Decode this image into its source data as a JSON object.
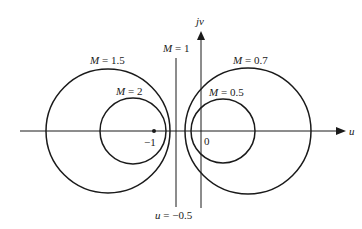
{
  "diagram": {
    "axes": {
      "horizontal_label": "u",
      "vertical_label": "jv",
      "origin_label": "0",
      "minus_one_label": "−1"
    },
    "circles": [
      {
        "label": "M = 1.5",
        "M": "1.5",
        "side": "left"
      },
      {
        "label": "M = 2",
        "M": "2",
        "side": "left"
      },
      {
        "label": "M = 0.7",
        "M": "0.7",
        "side": "right"
      },
      {
        "label": "M = 0.5",
        "M": "0.5",
        "side": "right"
      }
    ],
    "line": {
      "top_label": "M = 1",
      "bottom_label": "u = −0.5"
    },
    "colors": {
      "stroke": "#1a1a1a",
      "background": "#ffffff"
    }
  }
}
